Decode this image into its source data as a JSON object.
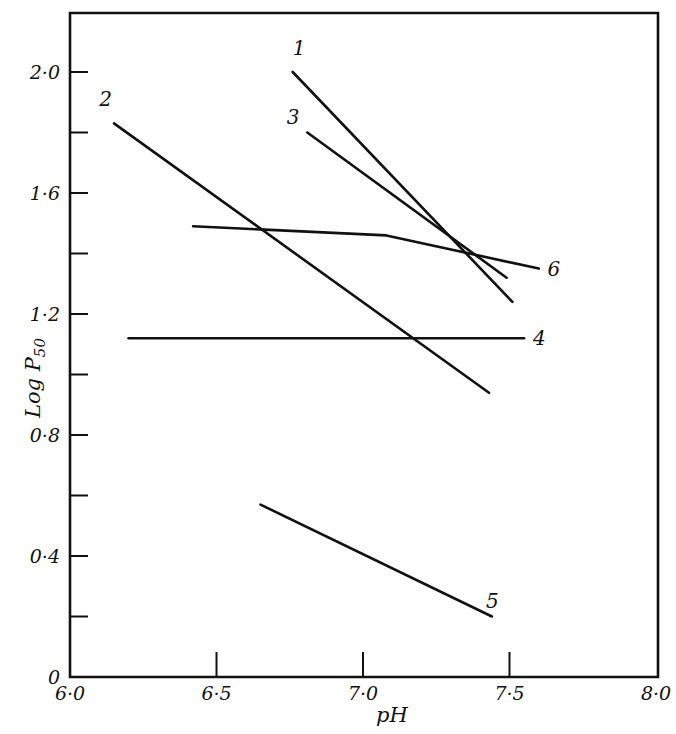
{
  "chart_data": {
    "type": "line",
    "title": "",
    "xlabel": "pH",
    "ylabel": "Log P50",
    "xlim": [
      6.0,
      8.0
    ],
    "ylim": [
      0,
      2.2
    ],
    "grid": false,
    "legend": "inline numeric labels at line ends",
    "x_ticks": [
      6.0,
      6.5,
      7.0,
      7.5,
      8.0
    ],
    "x_tick_labels": [
      "6·0",
      "6·5",
      "7·0",
      "7·5",
      "8·0"
    ],
    "y_ticks": [
      0,
      0.2,
      0.4,
      0.6,
      0.8,
      1.0,
      1.2,
      1.4,
      1.6,
      1.8,
      2.0
    ],
    "y_tick_labels": [
      "0",
      "",
      "0·4",
      "",
      "0·8",
      "",
      "1·2",
      "",
      "1·6",
      "",
      "2·0"
    ],
    "series": [
      {
        "name": "1",
        "points": [
          [
            6.76,
            2.0
          ],
          [
            7.51,
            1.24
          ]
        ],
        "label_pos": [
          6.76,
          2.08
        ]
      },
      {
        "name": "2",
        "points": [
          [
            6.15,
            1.83
          ],
          [
            7.43,
            0.94
          ]
        ],
        "label_pos": [
          6.1,
          1.91
        ]
      },
      {
        "name": "3",
        "points": [
          [
            6.81,
            1.8
          ],
          [
            7.49,
            1.32
          ]
        ],
        "label_pos": [
          6.74,
          1.85
        ]
      },
      {
        "name": "4",
        "points": [
          [
            6.2,
            1.12
          ],
          [
            7.55,
            1.12
          ]
        ],
        "label_pos": [
          7.58,
          1.12
        ]
      },
      {
        "name": "5",
        "points": [
          [
            6.65,
            0.57
          ],
          [
            7.44,
            0.2
          ]
        ],
        "label_pos": [
          7.42,
          0.25
        ]
      },
      {
        "name": "6",
        "points": [
          [
            6.42,
            1.49
          ],
          [
            7.08,
            1.46
          ],
          [
            7.6,
            1.35
          ]
        ],
        "label_pos": [
          7.63,
          1.35
        ]
      }
    ]
  }
}
